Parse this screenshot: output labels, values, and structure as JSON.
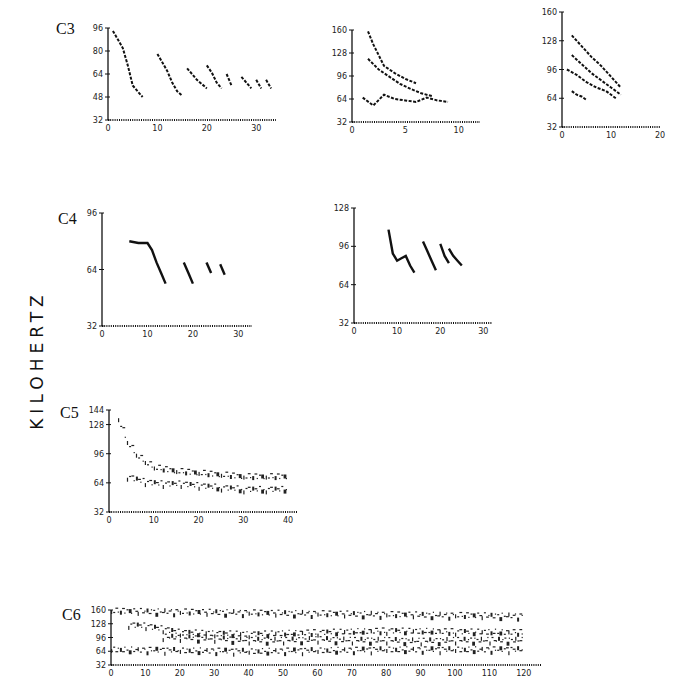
{
  "figure": {
    "ylabel": "KILOHERTZ",
    "panels": [
      "C3",
      "C4",
      "C5",
      "C6"
    ]
  },
  "chart_data": [
    {
      "id": "C3-a",
      "panel": "C3",
      "type": "scatter",
      "xlim": [
        0,
        34
      ],
      "ylim": [
        32,
        96
      ],
      "xticks": [
        0,
        10,
        20,
        30
      ],
      "yticks": [
        32,
        48,
        64,
        80,
        96
      ],
      "xlabel": "",
      "ylabel": "KILOHERTZ",
      "series": [
        {
          "name": "call1",
          "x": [
            1,
            2,
            3,
            4,
            5,
            6,
            7
          ],
          "y": [
            94,
            88,
            82,
            70,
            56,
            52,
            48
          ]
        },
        {
          "name": "call2",
          "x": [
            10,
            11,
            12,
            13,
            14,
            15
          ],
          "y": [
            78,
            72,
            66,
            58,
            52,
            49
          ]
        },
        {
          "name": "call3",
          "x": [
            16,
            17,
            18,
            19,
            20
          ],
          "y": [
            68,
            64,
            60,
            57,
            54
          ]
        },
        {
          "name": "call4",
          "x": [
            20,
            21,
            22,
            23
          ],
          "y": [
            70,
            65,
            58,
            54
          ]
        },
        {
          "name": "call5",
          "x": [
            24,
            25
          ],
          "y": [
            64,
            56
          ]
        },
        {
          "name": "call6",
          "x": [
            27,
            28,
            29
          ],
          "y": [
            62,
            58,
            54
          ]
        },
        {
          "name": "call7",
          "x": [
            30,
            31
          ],
          "y": [
            60,
            54
          ]
        },
        {
          "name": "call8",
          "x": [
            32,
            33
          ],
          "y": [
            60,
            54
          ]
        }
      ]
    },
    {
      "id": "C3-b",
      "panel": "C3",
      "type": "scatter",
      "xlim": [
        0,
        12
      ],
      "ylim": [
        32,
        160
      ],
      "xticks": [
        0,
        5,
        10
      ],
      "yticks": [
        32,
        64,
        96,
        128,
        160
      ],
      "series": [
        {
          "name": "harmonic-high",
          "x": [
            1.5,
            2,
            2.5,
            3,
            4,
            5,
            6
          ],
          "y": [
            158,
            140,
            125,
            110,
            100,
            92,
            86
          ]
        },
        {
          "name": "harmonic-mid",
          "x": [
            1.5,
            2.5,
            3.5,
            4.5,
            5.5,
            6.5,
            7.5
          ],
          "y": [
            120,
            105,
            95,
            85,
            78,
            72,
            68
          ]
        },
        {
          "name": "harmonic-low",
          "x": [
            1,
            2,
            3,
            4,
            5,
            6,
            7,
            8,
            9
          ],
          "y": [
            66,
            55,
            70,
            64,
            62,
            60,
            66,
            62,
            60
          ]
        }
      ]
    },
    {
      "id": "C3-c",
      "panel": "C3",
      "type": "scatter",
      "xlim": [
        0,
        20
      ],
      "ylim": [
        32,
        160
      ],
      "xticks": [
        0,
        10,
        20
      ],
      "yticks": [
        32,
        64,
        96,
        128,
        160
      ],
      "series": [
        {
          "name": "h4",
          "x": [
            2,
            4,
            6,
            8,
            10,
            12
          ],
          "y": [
            134,
            122,
            110,
            100,
            88,
            76
          ]
        },
        {
          "name": "h3",
          "x": [
            2,
            4,
            6,
            8,
            10,
            12
          ],
          "y": [
            112,
            102,
            92,
            84,
            76,
            68
          ]
        },
        {
          "name": "h2",
          "x": [
            1,
            3,
            5,
            7,
            9,
            11
          ],
          "y": [
            96,
            90,
            82,
            76,
            72,
            64
          ]
        },
        {
          "name": "h1",
          "x": [
            2,
            3,
            4,
            5
          ],
          "y": [
            72,
            68,
            66,
            62
          ]
        }
      ]
    },
    {
      "id": "C4-a",
      "panel": "C4",
      "type": "line",
      "xlim": [
        0,
        33
      ],
      "ylim": [
        32,
        96
      ],
      "xticks": [
        0,
        10,
        20,
        30
      ],
      "yticks": [
        32,
        64,
        96
      ],
      "series": [
        {
          "name": "call1",
          "x": [
            6,
            8,
            10,
            11,
            12,
            13,
            14
          ],
          "y": [
            80,
            79,
            79,
            75,
            68,
            62,
            56
          ]
        },
        {
          "name": "call2",
          "x": [
            18,
            19,
            20
          ],
          "y": [
            68,
            62,
            56
          ]
        },
        {
          "name": "call3",
          "x": [
            23,
            24
          ],
          "y": [
            68,
            62
          ]
        },
        {
          "name": "call4",
          "x": [
            26,
            27
          ],
          "y": [
            67,
            61
          ]
        }
      ]
    },
    {
      "id": "C4-b",
      "panel": "C4",
      "type": "line",
      "xlim": [
        0,
        32
      ],
      "ylim": [
        32,
        128
      ],
      "xticks": [
        0,
        10,
        20,
        30
      ],
      "yticks": [
        32,
        64,
        96,
        128
      ],
      "series": [
        {
          "name": "call1",
          "x": [
            8,
            9,
            10,
            11,
            12,
            13,
            14
          ],
          "y": [
            110,
            90,
            84,
            86,
            88,
            80,
            74
          ]
        },
        {
          "name": "call2",
          "x": [
            16,
            17,
            18,
            19
          ],
          "y": [
            100,
            92,
            84,
            76
          ]
        },
        {
          "name": "call3",
          "x": [
            20,
            21,
            22
          ],
          "y": [
            98,
            88,
            82
          ]
        },
        {
          "name": "call4",
          "x": [
            22,
            23,
            24,
            25
          ],
          "y": [
            94,
            88,
            84,
            80
          ]
        }
      ]
    },
    {
      "id": "C5",
      "panel": "C5",
      "type": "scatter",
      "xlim": [
        0,
        42
      ],
      "ylim": [
        32,
        144
      ],
      "xticks": [
        0,
        10,
        20,
        30,
        40
      ],
      "yticks": [
        32,
        64,
        96,
        128,
        144
      ],
      "series": [
        {
          "name": "fundamental",
          "x": [
            2,
            4,
            6,
            8,
            10,
            15,
            20,
            25,
            30,
            35,
            40
          ],
          "y": [
            135,
            110,
            96,
            88,
            82,
            78,
            76,
            74,
            72,
            72,
            72
          ]
        },
        {
          "name": "lower-band",
          "x": [
            4,
            8,
            12,
            16,
            20,
            25,
            30,
            35,
            40
          ],
          "y": [
            72,
            66,
            64,
            64,
            62,
            60,
            58,
            58,
            58
          ]
        }
      ]
    },
    {
      "id": "C6",
      "panel": "C6",
      "type": "scatter",
      "xlim": [
        0,
        125
      ],
      "ylim": [
        32,
        160
      ],
      "xticks": [
        0,
        10,
        20,
        30,
        40,
        50,
        60,
        70,
        80,
        90,
        100,
        110,
        120
      ],
      "yticks": [
        32,
        64,
        96,
        128,
        160
      ],
      "series": [
        {
          "name": "band-160",
          "x": [
            0,
            20,
            40,
            60,
            80,
            100,
            120
          ],
          "y": [
            160,
            158,
            156,
            154,
            152,
            150,
            148
          ]
        },
        {
          "name": "band-120",
          "x": [
            5,
            10,
            15,
            20,
            30,
            40,
            60,
            80,
            100,
            120
          ],
          "y": [
            128,
            125,
            118,
            110,
            108,
            106,
            110,
            114,
            112,
            110
          ]
        },
        {
          "name": "band-96",
          "x": [
            15,
            20,
            30,
            40,
            50,
            60,
            70,
            80,
            90,
            100,
            110,
            120
          ],
          "y": [
            100,
            98,
            96,
            92,
            92,
            94,
            92,
            92,
            90,
            92,
            92,
            92
          ]
        },
        {
          "name": "band-70",
          "x": [
            0,
            20,
            40,
            60,
            80,
            100,
            120
          ],
          "y": [
            70,
            68,
            66,
            68,
            70,
            70,
            70
          ]
        }
      ]
    }
  ]
}
